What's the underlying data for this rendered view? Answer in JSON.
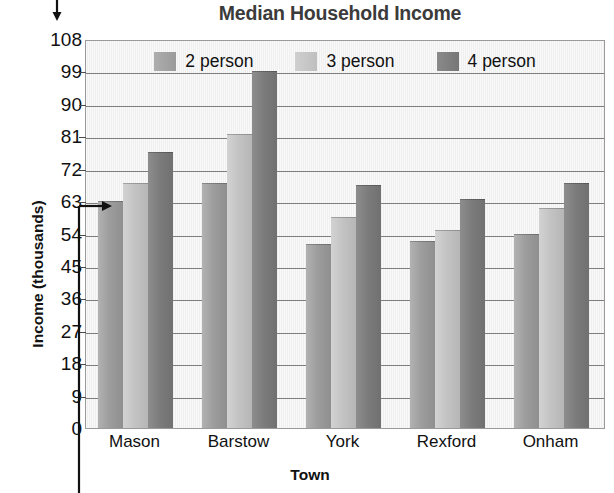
{
  "chart_data": {
    "type": "bar",
    "title": "Median Household Income",
    "xlabel": "Town",
    "ylabel": "Income (thousands)",
    "categories": [
      "Mason",
      "Barstow",
      "York",
      "Rexford",
      "Onham"
    ],
    "series": [
      {
        "name": "2 person",
        "color": "#9d9d9d",
        "values": [
          63,
          68,
          51,
          52,
          54
        ]
      },
      {
        "name": "3 person",
        "color": "#c2c2c2",
        "values": [
          68,
          81.5,
          58.5,
          55,
          61
        ]
      },
      {
        "name": "4 person",
        "color": "#7b7b7b",
        "values": [
          76.5,
          99,
          67.5,
          63.5,
          68
        ]
      }
    ],
    "ylim": [
      0,
      108
    ],
    "ytick_step": 9,
    "yticks": [
      108,
      99,
      90,
      81,
      72,
      63,
      54,
      45,
      36,
      27,
      18,
      9,
      0
    ],
    "grid": true,
    "legend_position": "top-inside"
  },
  "annotations": {
    "top_arrow": "down-arrow-marker",
    "value_pointer": "arrow-pointing-to-63-gridline"
  }
}
